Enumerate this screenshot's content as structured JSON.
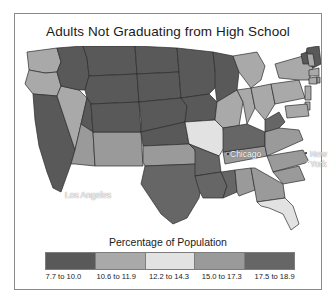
{
  "title": "Adults Not Graduating from High School",
  "legend": {
    "title": "Percentage of Population",
    "classes": [
      {
        "label": "7.7 to 10.0",
        "color": "#595959"
      },
      {
        "label": "10.6 to 11.9",
        "color": "#a9a9a9"
      },
      {
        "label": "12.2 to 14.3",
        "color": "#e2e2e2"
      },
      {
        "label": "15.0 to 17.3",
        "color": "#9a9a9a"
      },
      {
        "label": "17.5 to 18.9",
        "color": "#666666"
      }
    ]
  },
  "cities": [
    {
      "name": "Chicago",
      "label": "Chicago"
    },
    {
      "name": "New York",
      "label": "New York"
    },
    {
      "name": "Los Angeles",
      "label": "Los Angeles"
    }
  ],
  "chart_data": {
    "type": "choropleth",
    "title": "Adults Not Graduating from High School",
    "legend_title": "Percentage of Population",
    "value_unit": "percent",
    "class_breaks": [
      {
        "label": "7.7 to 10.0",
        "min": 7.7,
        "max": 10.0,
        "color": "#595959"
      },
      {
        "label": "10.6 to 11.9",
        "min": 10.6,
        "max": 11.9,
        "color": "#a9a9a9"
      },
      {
        "label": "12.2 to 14.3",
        "min": 12.2,
        "max": 14.3,
        "color": "#e2e2e2"
      },
      {
        "label": "15.0 to 17.3",
        "min": 15.0,
        "max": 17.3,
        "color": "#9a9a9a"
      },
      {
        "label": "17.5 to 18.9",
        "min": 17.5,
        "max": 18.9,
        "color": "#666666"
      }
    ],
    "regions": [
      {
        "code": "WA",
        "class": 1
      },
      {
        "code": "OR",
        "class": 1
      },
      {
        "code": "CA",
        "class": 0
      },
      {
        "code": "NV",
        "class": 1
      },
      {
        "code": "ID",
        "class": 0
      },
      {
        "code": "MT",
        "class": 0
      },
      {
        "code": "WY",
        "class": 0
      },
      {
        "code": "UT",
        "class": 0
      },
      {
        "code": "AZ",
        "class": 3
      },
      {
        "code": "NM",
        "class": 3
      },
      {
        "code": "CO",
        "class": 0
      },
      {
        "code": "ND",
        "class": 0
      },
      {
        "code": "SD",
        "class": 0
      },
      {
        "code": "NE",
        "class": 0
      },
      {
        "code": "KS",
        "class": 0
      },
      {
        "code": "OK",
        "class": 3
      },
      {
        "code": "TX",
        "class": 4
      },
      {
        "code": "MN",
        "class": 0
      },
      {
        "code": "IA",
        "class": 0
      },
      {
        "code": "MO",
        "class": 2
      },
      {
        "code": "AR",
        "class": 4
      },
      {
        "code": "LA",
        "class": 4
      },
      {
        "code": "WI",
        "class": 0
      },
      {
        "code": "IL",
        "class": 1
      },
      {
        "code": "MS",
        "class": 4
      },
      {
        "code": "AL",
        "class": 3
      },
      {
        "code": "TN",
        "class": 3
      },
      {
        "code": "KY",
        "class": 4
      },
      {
        "code": "IN",
        "class": 1
      },
      {
        "code": "MI",
        "class": 1
      },
      {
        "code": "OH",
        "class": 1
      },
      {
        "code": "WV",
        "class": 4
      },
      {
        "code": "VA",
        "class": 3
      },
      {
        "code": "NC",
        "class": 3
      },
      {
        "code": "SC",
        "class": 3
      },
      {
        "code": "GA",
        "class": 3
      },
      {
        "code": "FL",
        "class": 2
      },
      {
        "code": "PA",
        "class": 1
      },
      {
        "code": "NY",
        "class": 1
      },
      {
        "code": "ME",
        "class": 0
      },
      {
        "code": "VT",
        "class": 0
      },
      {
        "code": "NH",
        "class": 1
      },
      {
        "code": "MA",
        "class": 1
      },
      {
        "code": "CT",
        "class": 1
      },
      {
        "code": "RI",
        "class": 3
      },
      {
        "code": "NJ",
        "class": 1
      },
      {
        "code": "DE",
        "class": 1
      },
      {
        "code": "MD",
        "class": 1
      }
    ],
    "city_markers": [
      "Chicago",
      "New York",
      "Los Angeles"
    ]
  }
}
